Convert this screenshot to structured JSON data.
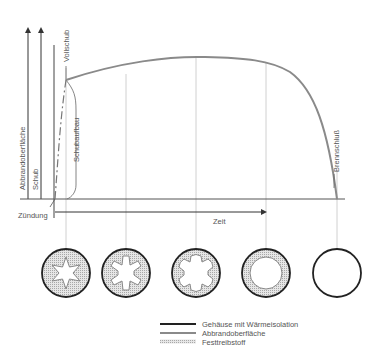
{
  "diagram": {
    "axis_labels": {
      "abbrandoberflaeche": "Abbrandoberfläche",
      "schub": "Schub",
      "vollschub": "Vollschub",
      "schubaufbau": "Schubaufbau",
      "brennschluss": "Brennschluß",
      "zuendung": "Zündung",
      "zeit": "Zeit"
    },
    "cross_sections": [
      {
        "stage": 1,
        "shape": "6-point star bore"
      },
      {
        "stage": 2,
        "shape": "eroded star bore"
      },
      {
        "stage": 3,
        "shape": "rounded star bore"
      },
      {
        "stage": 4,
        "shape": "circular bore (thin propellant ring)"
      },
      {
        "stage": 5,
        "shape": "empty casing"
      }
    ],
    "legend": [
      {
        "label": "Gehäuse mit Wärmeisolation",
        "style": "thick dark line"
      },
      {
        "label": "Abbrandoberfläche",
        "style": "grey line"
      },
      {
        "label": "Festtreibstoff",
        "style": "dotted hatch"
      }
    ],
    "colors": {
      "casing": "#222222",
      "burn_surface": "#8a8a8a",
      "propellant_fill": "#d9d9d9",
      "grid": "#bdbdbd",
      "axis": "#444444",
      "text": "#555555"
    }
  }
}
